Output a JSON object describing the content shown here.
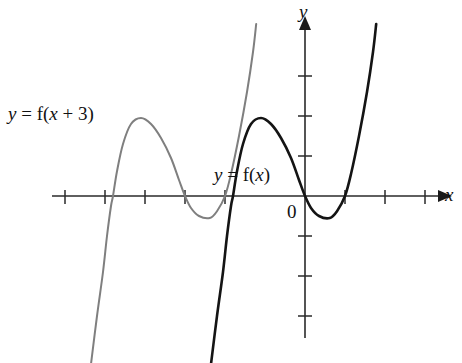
{
  "figure": {
    "background_color": "#ffffff"
  },
  "labels": {
    "shifted_curve": {
      "text": "y = f(x + 3)",
      "y_part": "y",
      "eq_part": " = ",
      "f_part": "f(",
      "x_part": "x",
      "tail_part": " + 3)"
    },
    "original_curve": {
      "text": "y = f(x)",
      "y_part": "y",
      "eq_part": " = ",
      "f_part": "f(",
      "x_part": "x",
      "tail_part": ")"
    },
    "y_axis": "y",
    "x_axis": "x",
    "origin": "0"
  },
  "colors": {
    "original_curve": "#141414",
    "shifted_curve": "#7f7f7f",
    "axis": "#2a2a2a",
    "text": "#111111"
  },
  "chart_data": {
    "type": "line",
    "xlabel": "x",
    "ylabel": "y",
    "grid": false,
    "legend_position": "inline-annotation",
    "axes": {
      "origin_px": [
        305,
        196
      ],
      "unit_px": 40,
      "x_tick_values": [
        -6,
        -5,
        -4,
        -3,
        -2,
        1,
        2,
        3
      ],
      "y_tick_values": [
        -1,
        -2,
        -3,
        1,
        2,
        3
      ],
      "xlim": [
        -6.6,
        3.4
      ],
      "ylim": [
        -4.2,
        4.3
      ],
      "x_axis_arrow": true,
      "y_axis_arrow": true
    },
    "series": [
      {
        "name": "y = f(x)",
        "color": "#141414",
        "roots": [
          -1.8,
          0,
          1
        ],
        "local_max": {
          "x": -1.1,
          "y": 1.95
        },
        "local_min": {
          "x": 0.62,
          "y": -0.55
        },
        "points": [
          [
            -2.35,
            -4.2
          ],
          [
            -2.2,
            -3.0
          ],
          [
            -2.05,
            -1.9
          ],
          [
            -1.95,
            -1.0
          ],
          [
            -1.85,
            -0.25
          ],
          [
            -1.8,
            0.0
          ],
          [
            -1.7,
            0.62
          ],
          [
            -1.55,
            1.3
          ],
          [
            -1.35,
            1.8
          ],
          [
            -1.1,
            1.95
          ],
          [
            -0.85,
            1.8
          ],
          [
            -0.6,
            1.45
          ],
          [
            -0.35,
            0.95
          ],
          [
            -0.15,
            0.4
          ],
          [
            0.0,
            0.0
          ],
          [
            0.15,
            -0.3
          ],
          [
            0.35,
            -0.5
          ],
          [
            0.62,
            -0.55
          ],
          [
            0.8,
            -0.38
          ],
          [
            1.0,
            0.0
          ],
          [
            1.15,
            0.55
          ],
          [
            1.35,
            1.5
          ],
          [
            1.55,
            2.6
          ],
          [
            1.7,
            3.6
          ],
          [
            1.78,
            4.3
          ]
        ]
      },
      {
        "name": "y = f(x + 3)",
        "color": "#7f7f7f",
        "roots": [
          -4.8,
          -3.0,
          -2.0
        ],
        "local_max": {
          "x": -4.1,
          "y": 1.95
        },
        "local_min": {
          "x": -2.38,
          "y": -0.55
        },
        "points": [
          [
            -5.35,
            -4.2
          ],
          [
            -5.2,
            -3.0
          ],
          [
            -5.05,
            -1.9
          ],
          [
            -4.95,
            -1.0
          ],
          [
            -4.85,
            -0.25
          ],
          [
            -4.8,
            0.0
          ],
          [
            -4.7,
            0.62
          ],
          [
            -4.55,
            1.3
          ],
          [
            -4.35,
            1.8
          ],
          [
            -4.1,
            1.95
          ],
          [
            -3.85,
            1.8
          ],
          [
            -3.6,
            1.45
          ],
          [
            -3.35,
            0.95
          ],
          [
            -3.15,
            0.4
          ],
          [
            -3.0,
            0.0
          ],
          [
            -2.85,
            -0.3
          ],
          [
            -2.65,
            -0.5
          ],
          [
            -2.38,
            -0.55
          ],
          [
            -2.2,
            -0.38
          ],
          [
            -2.0,
            0.0
          ],
          [
            -1.85,
            0.55
          ],
          [
            -1.65,
            1.5
          ],
          [
            -1.45,
            2.6
          ],
          [
            -1.3,
            3.6
          ],
          [
            -1.22,
            4.3
          ]
        ]
      }
    ],
    "annotations": [
      {
        "text": "y = f(x + 3)",
        "px": [
          8,
          104
        ]
      },
      {
        "text": "y = f(x)",
        "px": [
          214,
          165
        ]
      },
      {
        "text": "0",
        "px": [
          287,
          202
        ]
      }
    ]
  }
}
